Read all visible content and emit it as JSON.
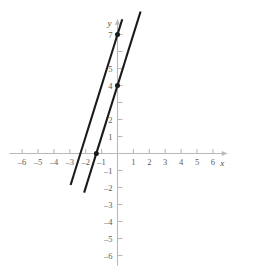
{
  "chart_data": {
    "type": "line",
    "title": "",
    "xlabel": "x",
    "ylabel": "y",
    "xlim": [
      -6.8,
      6.9
    ],
    "ylim": [
      -6.6,
      7.9
    ],
    "grid": false,
    "legend": "none",
    "x_ticks": [
      -6,
      -5,
      -4,
      -3,
      -2,
      -1,
      1,
      2,
      3,
      4,
      5,
      6
    ],
    "y_ticks": [
      -6,
      -5,
      -4,
      -3,
      -2,
      -1,
      1,
      2,
      4,
      5,
      7
    ],
    "x_tick_labels": [
      "-6",
      "-5",
      "-4",
      "-3",
      "-2",
      "-1",
      "1",
      "2",
      "3",
      "4",
      "5",
      "6"
    ],
    "y_tick_labels": [
      "-6",
      "-5",
      "-4",
      "-3",
      "-2",
      "-1",
      "1",
      "2",
      "4",
      "5",
      "7"
    ],
    "series": [
      {
        "name": "line-1",
        "slope": 3,
        "intercept": 7,
        "points": [
          [
            -2.95,
            -1.85
          ],
          [
            0.3,
            7.9
          ]
        ],
        "style": "solid",
        "color": "#1a1a1a"
      },
      {
        "name": "line-2",
        "slope": 3,
        "intercept": 4,
        "points": [
          [
            -2.1,
            -2.3
          ],
          [
            1.45,
            8.35
          ]
        ],
        "style": "solid",
        "color": "#1a1a1a"
      }
    ],
    "marked_points": [
      {
        "label": "",
        "x": 0,
        "y": 7
      },
      {
        "label": "",
        "x": 0,
        "y": 4
      },
      {
        "label": "",
        "x": -1.33,
        "y": 0
      }
    ],
    "axis_color": "#b9b9b9",
    "line_color": "#1a1a1a"
  },
  "axes": {
    "x_name": "x",
    "y_name": "y"
  }
}
